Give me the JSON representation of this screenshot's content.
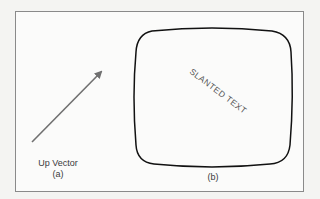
{
  "figure": {
    "panel_a": {
      "label": "Up Vector",
      "caption": "(a)",
      "arrow_color": "#707070"
    },
    "panel_b": {
      "slanted_text": "SLANTED TEXT",
      "caption": "(b)",
      "outline_color": "#111111"
    }
  }
}
